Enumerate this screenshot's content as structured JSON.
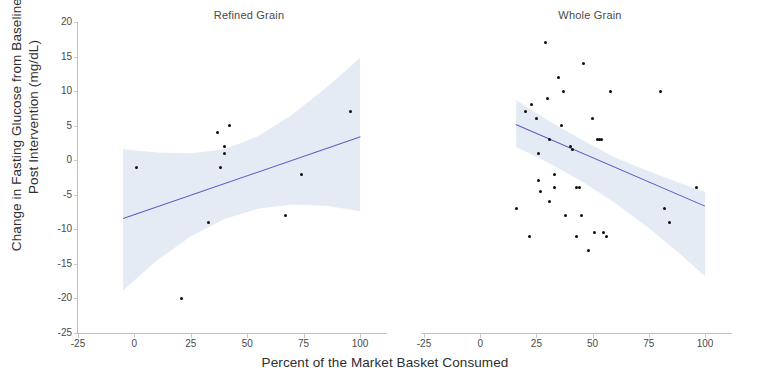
{
  "figure": {
    "y_axis_label": "Change in Fasting Glucose from Baseline to\nPost Intervention (mg/dL)",
    "x_axis_label": "Percent of the Market Basket Consumed"
  },
  "chart_data": {
    "type": "scatter",
    "title": "",
    "xlabel": "Percent of the Market Basket Consumed",
    "ylabel": "Change in Fasting Glucose from Baseline to Post Intervention (mg/dL)",
    "xlim": [
      -25,
      112
    ],
    "ylim": [
      -25,
      20
    ],
    "xticks": [
      -25,
      0,
      25,
      50,
      75,
      100
    ],
    "yticks": [
      20,
      15,
      10,
      5,
      0,
      -5,
      -10,
      -15,
      -20,
      -25
    ],
    "xtick_labels": [
      "-25",
      "0",
      "25",
      "50",
      "75",
      "100"
    ],
    "ytick_labels": [
      "20",
      "15",
      "10",
      "5",
      "0",
      "-5",
      "-10",
      "-15",
      "-20",
      "-25"
    ],
    "grid": false,
    "legend": "none",
    "marker_color": "#0d0d0d",
    "fit_line_color": "#5b5bc4",
    "confidence_band_color": "#dfe7f2",
    "panels": [
      {
        "label": "Refined Grain",
        "points": [
          {
            "x": 1,
            "y": -1
          },
          {
            "x": 21,
            "y": -20
          },
          {
            "x": 33,
            "y": -9
          },
          {
            "x": 37,
            "y": 4
          },
          {
            "x": 38,
            "y": -1
          },
          {
            "x": 40,
            "y": 1
          },
          {
            "x": 42,
            "y": 5
          },
          {
            "x": 40,
            "y": 2
          },
          {
            "x": 67,
            "y": -8
          },
          {
            "x": 74,
            "y": -2
          },
          {
            "x": 96,
            "y": 7
          }
        ],
        "fit": {
          "x0": -5,
          "y0": -8.4,
          "x1": 100,
          "y1": 3.4
        },
        "band_upper": [
          {
            "x": -5,
            "y": 1.6
          },
          {
            "x": 10,
            "y": 1.1
          },
          {
            "x": 25,
            "y": 1.0
          },
          {
            "x": 40,
            "y": 1.6
          },
          {
            "x": 55,
            "y": 3.5
          },
          {
            "x": 70,
            "y": 6.6
          },
          {
            "x": 85,
            "y": 10.5
          },
          {
            "x": 100,
            "y": 14.8
          }
        ],
        "band_lower": [
          {
            "x": -5,
            "y": -18.8
          },
          {
            "x": 10,
            "y": -14.5
          },
          {
            "x": 25,
            "y": -11.0
          },
          {
            "x": 40,
            "y": -8.5
          },
          {
            "x": 55,
            "y": -7.0
          },
          {
            "x": 70,
            "y": -6.4
          },
          {
            "x": 85,
            "y": -6.6
          },
          {
            "x": 100,
            "y": -7.4
          }
        ]
      },
      {
        "label": "Whole Grain",
        "points": [
          {
            "x": 16,
            "y": -7
          },
          {
            "x": 20,
            "y": 7
          },
          {
            "x": 23,
            "y": 8
          },
          {
            "x": 25,
            "y": 6
          },
          {
            "x": 26,
            "y": 1
          },
          {
            "x": 26,
            "y": -3
          },
          {
            "x": 27,
            "y": -4.5
          },
          {
            "x": 22,
            "y": -11
          },
          {
            "x": 29,
            "y": 17
          },
          {
            "x": 30,
            "y": 9
          },
          {
            "x": 31,
            "y": 3
          },
          {
            "x": 31,
            "y": -6
          },
          {
            "x": 33,
            "y": -2
          },
          {
            "x": 33,
            "y": -4
          },
          {
            "x": 35,
            "y": 12
          },
          {
            "x": 37,
            "y": 10
          },
          {
            "x": 36,
            "y": 5
          },
          {
            "x": 38,
            "y": -8
          },
          {
            "x": 40,
            "y": 2
          },
          {
            "x": 41,
            "y": 1.5
          },
          {
            "x": 43,
            "y": -4
          },
          {
            "x": 44,
            "y": -4
          },
          {
            "x": 43,
            "y": -11
          },
          {
            "x": 45,
            "y": -8
          },
          {
            "x": 46,
            "y": 14
          },
          {
            "x": 48,
            "y": -13
          },
          {
            "x": 50,
            "y": 6
          },
          {
            "x": 51,
            "y": -10.5
          },
          {
            "x": 52,
            "y": 3
          },
          {
            "x": 53,
            "y": 3
          },
          {
            "x": 54,
            "y": 3
          },
          {
            "x": 55,
            "y": -10.5
          },
          {
            "x": 56,
            "y": -11
          },
          {
            "x": 58,
            "y": 10
          },
          {
            "x": 80,
            "y": 10
          },
          {
            "x": 82,
            "y": -7
          },
          {
            "x": 84,
            "y": -9
          },
          {
            "x": 96,
            "y": -4
          }
        ],
        "fit": {
          "x0": 16,
          "y0": 5.3,
          "x1": 100,
          "y1": -6.5
        },
        "band_upper": [
          {
            "x": 16,
            "y": 8.7
          },
          {
            "x": 30,
            "y": 5.8
          },
          {
            "x": 45,
            "y": 3.0
          },
          {
            "x": 60,
            "y": 0.4
          },
          {
            "x": 75,
            "y": -1.6
          },
          {
            "x": 88,
            "y": -3.2
          },
          {
            "x": 100,
            "y": -4.6
          }
        ],
        "band_lower": [
          {
            "x": 16,
            "y": 1.9
          },
          {
            "x": 30,
            "y": -0.3
          },
          {
            "x": 45,
            "y": -3.0
          },
          {
            "x": 60,
            "y": -6.2
          },
          {
            "x": 75,
            "y": -9.8
          },
          {
            "x": 88,
            "y": -13.3
          },
          {
            "x": 100,
            "y": -16.8
          }
        ]
      }
    ]
  }
}
